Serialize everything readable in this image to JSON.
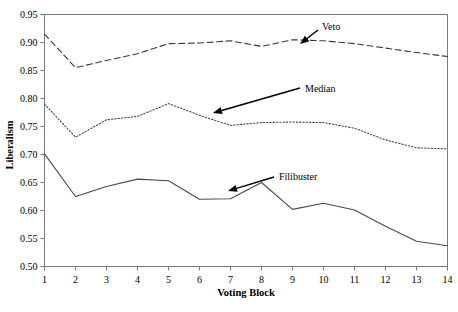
{
  "chart_data": {
    "type": "line",
    "title": "",
    "xlabel": "Voting Block",
    "ylabel": "Liberalism",
    "x": [
      1,
      2,
      3,
      4,
      5,
      6,
      7,
      8,
      9,
      10,
      11,
      12,
      13,
      14
    ],
    "xtick_labels": [
      "1",
      "2",
      "3",
      "4",
      "5",
      "6",
      "7",
      "8",
      "9",
      "10",
      "11",
      "12",
      "13",
      "14"
    ],
    "ytick_labels": [
      "0.50",
      "0.55",
      "0.60",
      "0.65",
      "0.70",
      "0.75",
      "0.80",
      "0.85",
      "0.90",
      "0.95"
    ],
    "ytick_values": [
      0.5,
      0.55,
      0.6,
      0.65,
      0.7,
      0.75,
      0.8,
      0.85,
      0.9,
      0.95
    ],
    "ylim": [
      0.5,
      0.95
    ],
    "xlim": [
      1,
      14
    ],
    "grid": false,
    "legend": "annotations",
    "series": [
      {
        "name": "Veto",
        "style": "dashed",
        "values": [
          0.915,
          0.855,
          0.868,
          0.88,
          0.898,
          0.899,
          0.903,
          0.893,
          0.905,
          0.903,
          0.898,
          0.89,
          0.882,
          0.875
        ]
      },
      {
        "name": "Median",
        "style": "dotted",
        "values": [
          0.79,
          0.731,
          0.762,
          0.768,
          0.791,
          0.77,
          0.752,
          0.757,
          0.758,
          0.757,
          0.747,
          0.726,
          0.712,
          0.71
        ]
      },
      {
        "name": "Filibuster",
        "style": "solid",
        "values": [
          0.701,
          0.625,
          0.643,
          0.656,
          0.653,
          0.62,
          0.621,
          0.65,
          0.602,
          0.613,
          0.601,
          0.572,
          0.545,
          0.537
        ]
      }
    ],
    "annotations": [
      {
        "label": "Veto",
        "text_x": 322,
        "text_y": 26,
        "arrow_from_x": 318,
        "arrow_from_y": 30,
        "arrow_to_x": 300,
        "arrow_to_y": 44
      },
      {
        "label": "Median",
        "text_x": 305,
        "text_y": 88,
        "arrow_from_x": 300,
        "arrow_from_y": 88,
        "arrow_to_x": 213,
        "arrow_to_y": 113
      },
      {
        "label": "Filibuster",
        "text_x": 279,
        "text_y": 176,
        "arrow_from_x": 274,
        "arrow_from_y": 177,
        "arrow_to_x": 228,
        "arrow_to_y": 191
      }
    ]
  }
}
